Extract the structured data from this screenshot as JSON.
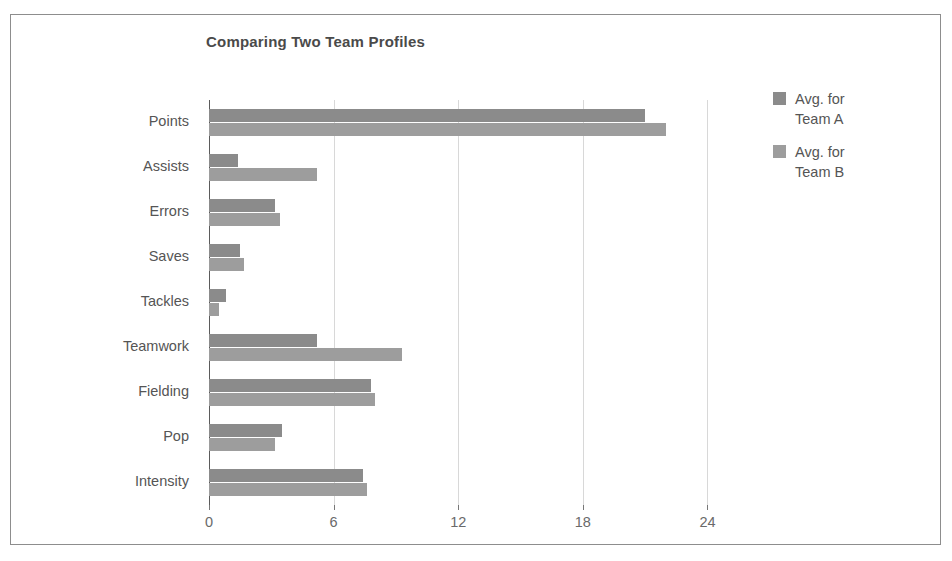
{
  "chart_data": {
    "type": "bar",
    "orientation": "horizontal",
    "title": "Comparing Two Team Profiles",
    "xlabel": "",
    "ylabel": "",
    "xlim": [
      0,
      26
    ],
    "xticks": [
      0,
      6,
      12,
      18,
      24
    ],
    "xtick_labels": [
      "0",
      "6",
      "12",
      "18",
      "24"
    ],
    "grid": true,
    "legend_position": "right",
    "categories": [
      "Points",
      "Assists",
      "Errors",
      "Saves",
      "Tackles",
      "Teamwork",
      "Fielding",
      "Pop",
      "Intensity"
    ],
    "series": [
      {
        "name": "Avg. for\nTeam A",
        "color": "#8b8b8b",
        "values": [
          21.0,
          1.4,
          3.2,
          1.5,
          0.8,
          5.2,
          7.8,
          3.5,
          7.4
        ]
      },
      {
        "name": "Avg. for\nTeam B",
        "color": "#9d9d9d",
        "values": [
          22.0,
          5.2,
          3.4,
          1.7,
          0.5,
          9.3,
          8.0,
          3.2,
          7.6
        ]
      }
    ]
  },
  "legend": {
    "items": [
      {
        "label": "Avg. for\nTeam A",
        "swatch": "series-a"
      },
      {
        "label": "Avg. for\nTeam B",
        "swatch": "series-b"
      }
    ]
  }
}
